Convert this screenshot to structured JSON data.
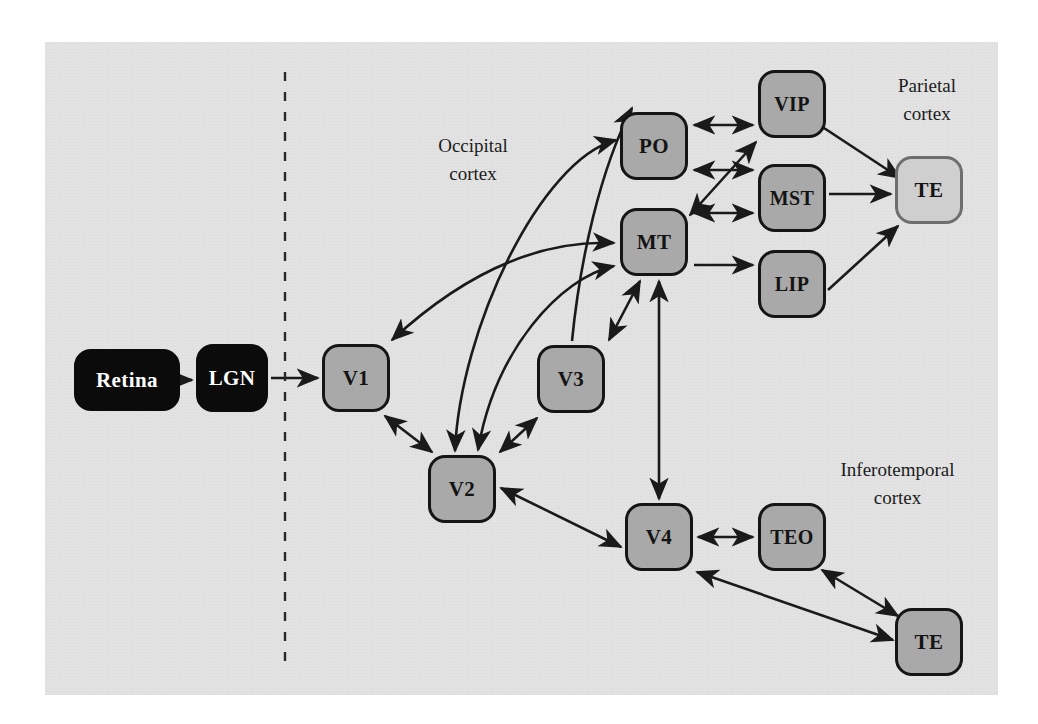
{
  "figure": {
    "type": "diagram",
    "background_color": "#e2e2e2",
    "page_color": "#ffffff",
    "divider": {
      "name": "subcortical-cortical-divider",
      "style": "dashed-vertical"
    }
  },
  "palette": {
    "subcortical_fill": "#0b0b0b",
    "subcortical_text": "#ffffff",
    "cortical_fill": "#a9a9a9",
    "cortical_border": "#151515",
    "highlight_fill": "#cfcfcf",
    "highlight_border": "#6e6e6e",
    "edge_color": "#1a1a1a"
  },
  "region_labels": [
    {
      "name": "occipital-cortex-label",
      "line1": "Occipital",
      "line2": "cortex",
      "x": 388,
      "y": 132,
      "width": 170
    },
    {
      "name": "parietal-cortex-label",
      "line1": "Parietal",
      "line2": "cortex",
      "x": 852,
      "y": 72,
      "width": 150
    },
    {
      "name": "inferotemporal-cortex-label",
      "line1": "Inferotemporal",
      "line2": "cortex",
      "x": 790,
      "y": 456,
      "width": 215
    }
  ],
  "nodes": [
    {
      "id": "retina",
      "label": "Retina",
      "style": "dark",
      "x": 74,
      "y": 349,
      "w": 106,
      "h": 62,
      "font": 21
    },
    {
      "id": "lgn",
      "label": "LGN",
      "style": "dark",
      "x": 196,
      "y": 344,
      "w": 72,
      "h": 68,
      "font": 21
    },
    {
      "id": "v1",
      "label": "V1",
      "style": "mid",
      "x": 322,
      "y": 344,
      "w": 68,
      "h": 68,
      "font": 21
    },
    {
      "id": "v2",
      "label": "V2",
      "style": "mid",
      "x": 428,
      "y": 455,
      "w": 68,
      "h": 68,
      "font": 21
    },
    {
      "id": "v3",
      "label": "V3",
      "style": "mid",
      "x": 537,
      "y": 345,
      "w": 68,
      "h": 68,
      "font": 21
    },
    {
      "id": "po",
      "label": "PO",
      "style": "mid",
      "x": 620,
      "y": 112,
      "w": 68,
      "h": 68,
      "font": 21
    },
    {
      "id": "mt",
      "label": "MT",
      "style": "mid",
      "x": 620,
      "y": 208,
      "w": 68,
      "h": 68,
      "font": 21
    },
    {
      "id": "vip",
      "label": "VIP",
      "style": "mid",
      "x": 758,
      "y": 70,
      "w": 68,
      "h": 68,
      "font": 20
    },
    {
      "id": "mst",
      "label": "MST",
      "style": "mid",
      "x": 758,
      "y": 164,
      "w": 68,
      "h": 68,
      "font": 20
    },
    {
      "id": "lip",
      "label": "LIP",
      "style": "mid",
      "x": 758,
      "y": 250,
      "w": 68,
      "h": 68,
      "font": 20
    },
    {
      "id": "te_par",
      "label": "TE",
      "style": "light",
      "x": 895,
      "y": 156,
      "w": 68,
      "h": 68,
      "font": 21
    },
    {
      "id": "v4",
      "label": "V4",
      "style": "mid",
      "x": 625,
      "y": 503,
      "w": 68,
      "h": 68,
      "font": 21
    },
    {
      "id": "teo",
      "label": "TEO",
      "style": "mid",
      "x": 758,
      "y": 503,
      "w": 68,
      "h": 68,
      "font": 20
    },
    {
      "id": "te_it",
      "label": "TE",
      "style": "mid",
      "x": 895,
      "y": 608,
      "w": 68,
      "h": 68,
      "font": 21
    }
  ],
  "edges": [
    {
      "from": "retina",
      "to": "lgn",
      "dir": "one-way"
    },
    {
      "from": "lgn",
      "to": "v1",
      "dir": "one-way"
    },
    {
      "from": "v1",
      "to": "v2",
      "dir": "two-way"
    },
    {
      "from": "v1",
      "to": "mt",
      "dir": "two-way"
    },
    {
      "from": "v2",
      "to": "v3",
      "dir": "two-way"
    },
    {
      "from": "v2",
      "to": "po",
      "dir": "two-way"
    },
    {
      "from": "v2",
      "to": "mt",
      "dir": "two-way"
    },
    {
      "from": "v3",
      "to": "po",
      "dir": "one-way"
    },
    {
      "from": "v3",
      "to": "mt",
      "dir": "two-way"
    },
    {
      "from": "po",
      "to": "vip",
      "dir": "two-way"
    },
    {
      "from": "po",
      "to": "mst",
      "dir": "two-way"
    },
    {
      "from": "mt",
      "to": "vip",
      "dir": "two-way"
    },
    {
      "from": "mt",
      "to": "mst",
      "dir": "two-way"
    },
    {
      "from": "mt",
      "to": "lip",
      "dir": "one-way"
    },
    {
      "from": "mt",
      "to": "v4",
      "dir": "two-way"
    },
    {
      "from": "vip",
      "to": "te_par",
      "dir": "one-way"
    },
    {
      "from": "mst",
      "to": "te_par",
      "dir": "one-way"
    },
    {
      "from": "lip",
      "to": "te_par",
      "dir": "one-way"
    },
    {
      "from": "v2",
      "to": "v4",
      "dir": "two-way"
    },
    {
      "from": "v4",
      "to": "teo",
      "dir": "two-way"
    },
    {
      "from": "v4",
      "to": "te_it",
      "dir": "two-way"
    },
    {
      "from": "teo",
      "to": "te_it",
      "dir": "two-way"
    }
  ]
}
